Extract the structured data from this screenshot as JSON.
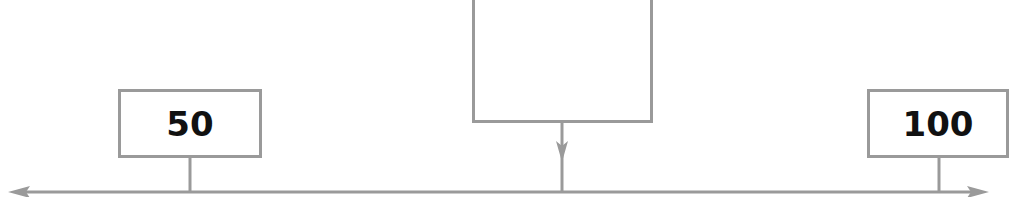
{
  "diagram": {
    "type": "number-line",
    "line_color": "#9a9a9a",
    "text_color": "#111111",
    "axis": {
      "y": 192,
      "x_start": 10,
      "x_end": 987,
      "double_headed": true
    },
    "left_marker": {
      "label": "50",
      "stem_x": 190
    },
    "right_marker": {
      "label": "100",
      "stem_x": 939
    },
    "unknown_marker": {
      "label": "",
      "stem_x": 562,
      "arrow": "down"
    }
  }
}
